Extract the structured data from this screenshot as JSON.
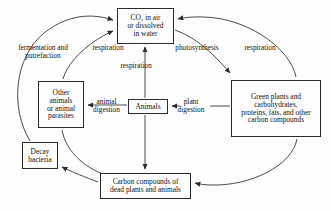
{
  "diagram": {
    "type": "cycle-flow-diagram",
    "background_color": "#fefefe",
    "line_color": "#2a2a2a",
    "text_color": "#111111",
    "nodes": [
      {
        "id": "co2",
        "label": "CO₂ in air\nor dissolved\nin water",
        "shape": "rectangle"
      },
      {
        "id": "other_animals",
        "label": "Other\nanimals\nor animal\nparasites",
        "shape": "rectangle"
      },
      {
        "id": "animals",
        "label": "Animals",
        "shape": "rectangle"
      },
      {
        "id": "green_plants",
        "label": "Green plants and\ncarbohydrates,\nproteins, fats, and other\ncarbon compounds",
        "shape": "rectangle"
      },
      {
        "id": "decay_bacteria",
        "label": "Decay\nbacteria",
        "shape": "rectangle"
      },
      {
        "id": "dead_matter",
        "label": "Carbon compounds of\ndead plants and animals",
        "shape": "rectangle"
      }
    ],
    "edge_labels": [
      {
        "id": "fermentation",
        "label": "fermentation and\nputrefaction",
        "from": "decay_bacteria",
        "to": "co2"
      },
      {
        "id": "respiration_left",
        "label": "respiration",
        "from": "other_animals",
        "to": "co2"
      },
      {
        "id": "photosynthesis",
        "label": "photosynthesis",
        "from": "co2",
        "to": "green_plants"
      },
      {
        "id": "respiration_right",
        "label": "respiration",
        "from": "green_plants",
        "to": "co2"
      },
      {
        "id": "respiration_center",
        "label": "respiration",
        "from": "animals",
        "to": "co2"
      },
      {
        "id": "animal_digestion",
        "label": "animal\ndigestion",
        "from": "animals",
        "to": "other_animals"
      },
      {
        "id": "plant_digestion",
        "label": "plant\ndigestion",
        "from": "green_plants",
        "to": "animals"
      }
    ],
    "unlabeled_edges": [
      {
        "from": "animals",
        "to": "dead_matter",
        "style": "straight-vertical"
      },
      {
        "from": "other_animals",
        "to": "dead_matter",
        "style": "curved"
      },
      {
        "from": "green_plants",
        "to": "dead_matter",
        "style": "curved"
      },
      {
        "from": "dead_matter",
        "to": "decay_bacteria",
        "style": "curved"
      }
    ]
  }
}
